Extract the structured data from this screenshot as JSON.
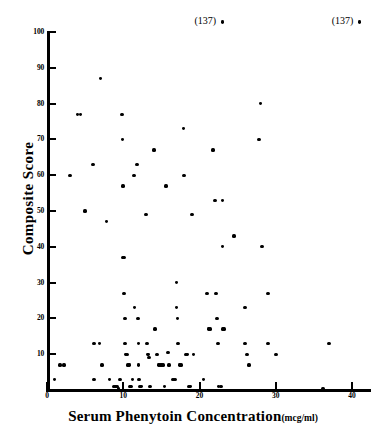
{
  "chart_data": {
    "type": "scatter",
    "title": "",
    "xlabel": "Serum Phenytoin Concentration",
    "xlabel_units": "(mcg/ml)",
    "ylabel": "Composite Score",
    "xlim": [
      0,
      42
    ],
    "ylim": [
      0,
      100
    ],
    "xticks": [
      0,
      10,
      20,
      30,
      40
    ],
    "yticks": [
      10,
      20,
      30,
      40,
      50,
      60,
      70,
      80,
      90,
      100
    ],
    "xtick_labels": [
      "0",
      "10",
      "20",
      "30",
      "40"
    ],
    "ytick_labels": [
      "10",
      "20",
      "30",
      "40",
      "50",
      "60",
      "70",
      "80",
      "90",
      "100"
    ],
    "grid": false,
    "legend": null,
    "marker": "filled-circle",
    "marker_color": "#000000",
    "points": [
      [
        0.2,
        7
      ],
      [
        1.0,
        3
      ],
      [
        1.7,
        7
      ],
      [
        2.2,
        7
      ],
      [
        3.0,
        60
      ],
      [
        4.0,
        77
      ],
      [
        4.4,
        77
      ],
      [
        5.0,
        50
      ],
      [
        6.0,
        63
      ],
      [
        6.2,
        13
      ],
      [
        6.2,
        3
      ],
      [
        6.9,
        13
      ],
      [
        7.0,
        87
      ],
      [
        7.2,
        7
      ],
      [
        7.8,
        47
      ],
      [
        8.2,
        3
      ],
      [
        8.8,
        1
      ],
      [
        9.0,
        1
      ],
      [
        9.2,
        1
      ],
      [
        9.4,
        0.5
      ],
      [
        9.6,
        3
      ],
      [
        9.8,
        77
      ],
      [
        9.9,
        70
      ],
      [
        10.0,
        57
      ],
      [
        10.0,
        37
      ],
      [
        10.1,
        37
      ],
      [
        10.1,
        27
      ],
      [
        10.2,
        20
      ],
      [
        10.2,
        13
      ],
      [
        10.3,
        10
      ],
      [
        10.5,
        10
      ],
      [
        10.6,
        7
      ],
      [
        10.8,
        7
      ],
      [
        10.9,
        1
      ],
      [
        11.0,
        1
      ],
      [
        11.2,
        3
      ],
      [
        11.4,
        60
      ],
      [
        11.5,
        23
      ],
      [
        11.8,
        63
      ],
      [
        11.9,
        20
      ],
      [
        12.0,
        13
      ],
      [
        12.0,
        7
      ],
      [
        12.1,
        3
      ],
      [
        12.2,
        1
      ],
      [
        12.4,
        1
      ],
      [
        13.0,
        49
      ],
      [
        13.1,
        13
      ],
      [
        13.2,
        10
      ],
      [
        13.3,
        10
      ],
      [
        13.4,
        9
      ],
      [
        13.5,
        1
      ],
      [
        14.0,
        67
      ],
      [
        14.2,
        17
      ],
      [
        14.4,
        10
      ],
      [
        14.6,
        7
      ],
      [
        14.8,
        7
      ],
      [
        15.0,
        7
      ],
      [
        15.2,
        7
      ],
      [
        15.4,
        1
      ],
      [
        15.6,
        57
      ],
      [
        15.9,
        10.5
      ],
      [
        16.0,
        7
      ],
      [
        16.5,
        3
      ],
      [
        16.8,
        3
      ],
      [
        17.0,
        30
      ],
      [
        17.0,
        23
      ],
      [
        17.1,
        20
      ],
      [
        17.2,
        13
      ],
      [
        17.4,
        7
      ],
      [
        17.6,
        7
      ],
      [
        17.9,
        73
      ],
      [
        18.0,
        60
      ],
      [
        18.2,
        10
      ],
      [
        18.4,
        10
      ],
      [
        18.6,
        1
      ],
      [
        18.8,
        1
      ],
      [
        19.0,
        49
      ],
      [
        19.2,
        10
      ],
      [
        20.5,
        3
      ],
      [
        21.0,
        27
      ],
      [
        21.2,
        17
      ],
      [
        21.4,
        17
      ],
      [
        21.8,
        67
      ],
      [
        22.0,
        53
      ],
      [
        22.2,
        27
      ],
      [
        22.3,
        20
      ],
      [
        22.4,
        13
      ],
      [
        22.5,
        1
      ],
      [
        22.8,
        1
      ],
      [
        23.0,
        53
      ],
      [
        23.0,
        40
      ],
      [
        23.1,
        17
      ],
      [
        23.2,
        17
      ],
      [
        24.5,
        43
      ],
      [
        26.0,
        23
      ],
      [
        26.0,
        13
      ],
      [
        26.2,
        10
      ],
      [
        26.5,
        7
      ],
      [
        27.8,
        70
      ],
      [
        28.0,
        80
      ],
      [
        28.2,
        40
      ],
      [
        29.0,
        27
      ],
      [
        29.0,
        13
      ],
      [
        30.0,
        10
      ],
      [
        36.2,
        0.5
      ],
      [
        37.0,
        13
      ]
    ],
    "offscale_points": [
      {
        "x": 23.0,
        "y": 137,
        "label": "(137)"
      },
      {
        "x": 41.0,
        "y": 137,
        "label": "(137)"
      }
    ]
  }
}
